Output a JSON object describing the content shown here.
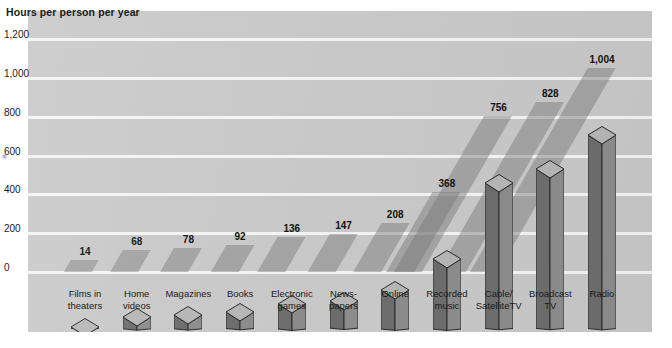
{
  "chart_data": {
    "type": "bar",
    "title": "Hours per person per year",
    "xlabel": "",
    "ylabel": "Hours per person per year",
    "ylim": [
      0,
      1200
    ],
    "yticks": [
      "0",
      "200",
      "400",
      "600",
      "800",
      "1,000",
      "1,200"
    ],
    "ytick_values": [
      0,
      200,
      400,
      600,
      800,
      1000,
      1200
    ],
    "grid": true,
    "legend": "none",
    "categories": [
      "Films in theaters",
      "Home videos",
      "Magazines",
      "Books",
      "Electronic games",
      "News-papers",
      "Online",
      "Recorded music",
      "Cable/SatelliteTV",
      "Broadcast TV",
      "Radio"
    ],
    "category_lines": [
      [
        "Films in",
        "theaters"
      ],
      [
        "Home",
        "videos"
      ],
      [
        "Magazines",
        ""
      ],
      [
        "Books",
        ""
      ],
      [
        "Electronic",
        "games"
      ],
      [
        "News-",
        "papers"
      ],
      [
        "Online",
        ""
      ],
      [
        "Recorded",
        "music"
      ],
      [
        "Cable/",
        "SatelliteTV"
      ],
      [
        "Broadcast",
        "TV"
      ],
      [
        "Radio",
        ""
      ]
    ],
    "values": [
      14,
      68,
      78,
      92,
      136,
      147,
      208,
      368,
      756,
      828,
      1004
    ],
    "value_labels": [
      "14",
      "68",
      "78",
      "92",
      "136",
      "147",
      "208",
      "368",
      "756",
      "828",
      "1,004"
    ]
  },
  "style": {
    "panel_background": "#c9c9c9",
    "gridline_color": "#f4f4f4",
    "bar_face_left": "#6e6e6e",
    "bar_face_right": "#8d8d8d",
    "bar_top_color": "#b7b7b7",
    "bar_outline": "#2b2b2b",
    "text_color": "#1a1a1a",
    "page_background": "#ffffff"
  }
}
